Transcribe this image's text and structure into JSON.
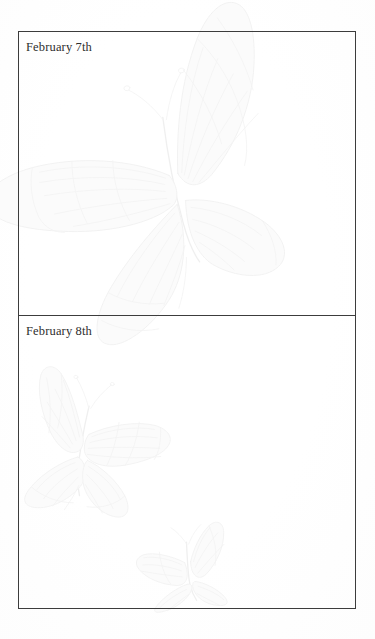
{
  "page": {
    "kind": "scanned-journal-page",
    "background_color": "#ffffff",
    "paper_color": "#fefefe",
    "rule_color": "#3c3c3c",
    "text_color": "#2e2e2e",
    "watermark_color": "#f2f2f2"
  },
  "entries": [
    {
      "date_label": "February 7th",
      "body_text": ""
    },
    {
      "date_label": "February 8th",
      "body_text": ""
    }
  ],
  "watermarks": [
    {
      "name": "butterfly-large",
      "description": "large monarch butterfly outline, wings spread, upper panel"
    },
    {
      "name": "butterfly-medium",
      "description": "medium monarch butterfly outline, lower panel left"
    },
    {
      "name": "butterfly-small",
      "description": "small monarch butterfly outline, lower panel bottom center"
    }
  ]
}
